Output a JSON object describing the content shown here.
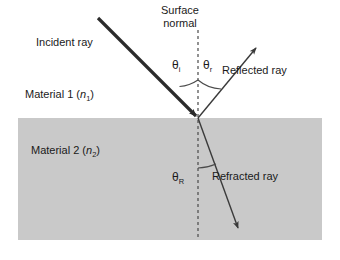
{
  "figure": {
    "background_color": "#ffffff",
    "material2_fill": "#c9c9c9",
    "ray_color": "#3a3a3a",
    "text_color": "#1a1a1a"
  },
  "labels": {
    "surface_normal_line1": "Surface",
    "surface_normal_line2": "normal",
    "incident_ray": "Incident ray",
    "reflected_ray": "Reflected ray",
    "refracted_ray": "Refracted ray",
    "material_1_prefix": "Material 1 (",
    "material_1_symbol": "n",
    "material_1_subscript": "1",
    "material_1_suffix": ")",
    "material_2_prefix": "Material 2 (",
    "material_2_symbol": "n",
    "material_2_subscript": "2",
    "material_2_suffix": ")",
    "theta_symbol": "θ",
    "theta_incident_sub": "i",
    "theta_reflected_sub": "r",
    "theta_refracted_sub": "R"
  },
  "geometry": {
    "interface_y": 118,
    "incidence_point_x": 198,
    "incidence_point_y": 118,
    "normal_top_y": 30,
    "normal_bottom_y": 240
  }
}
